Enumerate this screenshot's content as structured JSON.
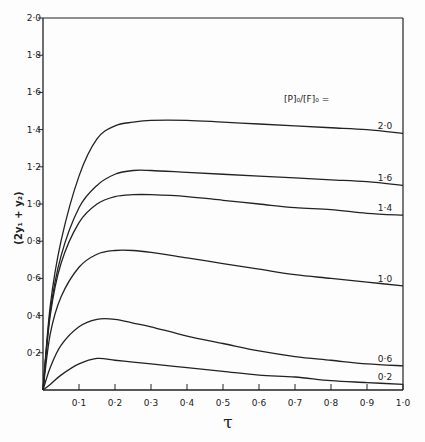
{
  "chart_data": {
    "type": "line",
    "title": "",
    "xlabel": "τ",
    "ylabel": "(2y₁ + y₂)",
    "xlim": [
      0,
      1.0
    ],
    "ylim": [
      0,
      2.0
    ],
    "grid": false,
    "x_ticks": [
      "0·1",
      "0·2",
      "0·3",
      "0·4",
      "0·5",
      "0·6",
      "0·7",
      "0·8",
      "0·9",
      "1·0"
    ],
    "y_ticks": [
      "0·2",
      "0·4",
      "0·6",
      "0·8",
      "1·0",
      "1·2",
      "1·4",
      "1·6",
      "1·8",
      "2·0"
    ],
    "legend_title": "[P]₀/[F]₀ =",
    "legend_position": "inline labels at right end of each curve",
    "x": [
      0,
      0.02,
      0.05,
      0.1,
      0.15,
      0.2,
      0.25,
      0.3,
      0.4,
      0.5,
      0.6,
      0.7,
      0.8,
      0.9,
      1.0
    ],
    "series": [
      {
        "name": "2·0",
        "values": [
          0,
          0.45,
          0.8,
          1.15,
          1.35,
          1.42,
          1.44,
          1.45,
          1.45,
          1.44,
          1.43,
          1.42,
          1.41,
          1.4,
          1.38
        ]
      },
      {
        "name": "1·6",
        "values": [
          0,
          0.42,
          0.72,
          0.98,
          1.1,
          1.16,
          1.18,
          1.18,
          1.17,
          1.16,
          1.15,
          1.14,
          1.13,
          1.12,
          1.1
        ]
      },
      {
        "name": "1·4",
        "values": [
          0,
          0.4,
          0.68,
          0.9,
          1.0,
          1.04,
          1.05,
          1.05,
          1.04,
          1.02,
          1.0,
          0.98,
          0.97,
          0.95,
          0.94
        ]
      },
      {
        "name": "1·0",
        "values": [
          0,
          0.3,
          0.5,
          0.66,
          0.73,
          0.75,
          0.75,
          0.74,
          0.71,
          0.68,
          0.65,
          0.62,
          0.6,
          0.58,
          0.56
        ]
      },
      {
        "name": "0·6",
        "values": [
          0,
          0.12,
          0.24,
          0.34,
          0.38,
          0.38,
          0.36,
          0.34,
          0.29,
          0.25,
          0.21,
          0.18,
          0.16,
          0.14,
          0.13
        ]
      },
      {
        "name": "0·2",
        "values": [
          0,
          0.03,
          0.08,
          0.14,
          0.17,
          0.16,
          0.15,
          0.14,
          0.12,
          0.1,
          0.08,
          0.07,
          0.05,
          0.04,
          0.03
        ]
      }
    ]
  }
}
